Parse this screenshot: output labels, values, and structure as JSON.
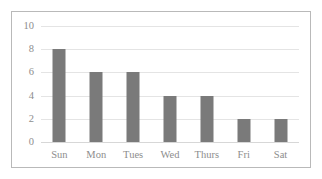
{
  "chart_data": {
    "type": "bar",
    "title": "",
    "subtitle": "",
    "xlabel": "",
    "ylabel": "",
    "categories": [
      "Sun",
      "Mon",
      "Tues",
      "Wed",
      "Thurs",
      "Fri",
      "Sat"
    ],
    "values": [
      8,
      6,
      6,
      4,
      4,
      2,
      2
    ],
    "ylim": [
      0,
      10
    ],
    "yticks": [
      0,
      2,
      4,
      6,
      8,
      10
    ],
    "ytick_labels": [
      "0",
      "2",
      "4",
      "6",
      "8",
      "10"
    ],
    "grid": true,
    "grid_axis": "y",
    "legend": false,
    "legend_position": "none",
    "annotations": [],
    "colors": {
      "bar": "#7a7a7a",
      "gridline": "#e4e4e4",
      "baseline": "#d7d7d7",
      "border": "#b9b9b9",
      "tick_text": "#8d8d8d",
      "background": "#ffffff"
    }
  }
}
